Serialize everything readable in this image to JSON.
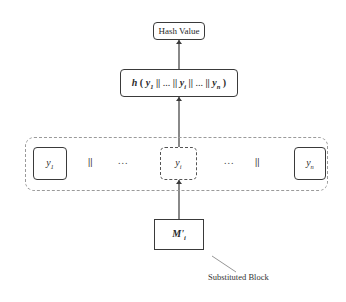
{
  "diagram": {
    "hash_value": {
      "label": "Hash Value"
    },
    "hash_function": {
      "fn": "h",
      "open": "(",
      "close": ")",
      "terms": [
        {
          "base": "y",
          "sub": "1"
        },
        {
          "base": "y",
          "sub": "i"
        },
        {
          "base": "y",
          "sub": "n"
        }
      ],
      "separator": "||",
      "ellipsis": "..."
    },
    "blocks_row": {
      "items": [
        {
          "base": "y",
          "sub": "1",
          "style": "solid"
        },
        {
          "separator": "||"
        },
        {
          "ellipsis": "..."
        },
        {
          "base": "y",
          "sub": "i",
          "style": "dashed"
        },
        {
          "ellipsis": "..."
        },
        {
          "separator": "||"
        },
        {
          "base": "y",
          "sub": "n",
          "style": "solid"
        }
      ]
    },
    "substituted_input": {
      "base": "M'",
      "sub": "i"
    },
    "annotation": {
      "label": "Substituted Block"
    },
    "colors": {
      "line": "#3a3a3a",
      "dashed_outer": "#9a9a9a",
      "background": "#ffffff"
    }
  }
}
